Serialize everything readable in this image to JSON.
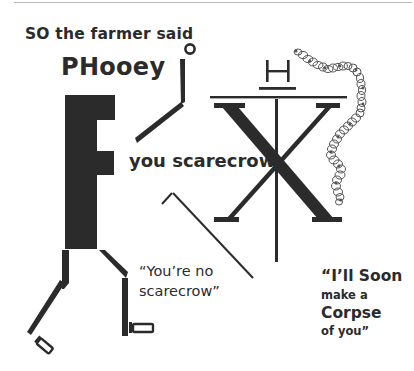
{
  "poster": {
    "line1": "SO the farmer said",
    "line2": "PHooey",
    "line3": "you scarecrow",
    "quote1": {
      "line_a": "“You’re no",
      "line_b": "scarecrow”"
    },
    "quote2": {
      "line_a": "“I’ll Soon",
      "line_b": "make a",
      "line_c": "Corpse",
      "line_d": "of you”"
    },
    "glyph_h": "H",
    "glyph_x": "X"
  },
  "colors": {
    "ink": "#2b2b2b",
    "rule": "#b9b9b9",
    "background": "#ffffff"
  },
  "icons": {
    "figure": "f-letter-figure",
    "helix": "dna-helix-chain",
    "stick": "thin-bent-stick"
  }
}
